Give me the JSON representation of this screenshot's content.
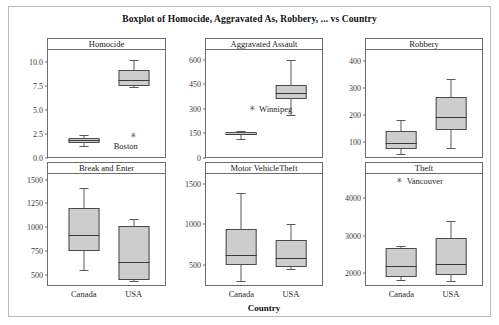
{
  "figure": {
    "title": "Boxplot of Homocide, Aggravated As, Robbery, ... vs Country",
    "xaxis_title": "Country",
    "categories": [
      "Canada",
      "USA"
    ],
    "box_fill": "#cdcdcd",
    "box_stroke": "#4a4a4a",
    "frame_color": "#b9b9b9"
  },
  "chart_data": {
    "type": "box",
    "title": "Boxplot of Homocide, Aggravated As, Robbery, ... vs Country",
    "xlabel": "Country",
    "ylabel": "",
    "grid": false,
    "legend": "none",
    "layout": "2 rows x 3 columns of panels",
    "categories": [
      "Canada",
      "USA"
    ],
    "panels": [
      {
        "name": "Homocide",
        "ylim": [
          0.0,
          11.3
        ],
        "yticks": [
          0.0,
          2.5,
          5.0,
          7.5,
          10.0
        ],
        "yticklabels": [
          "0.0",
          "2.5",
          "5.0",
          "7.5",
          "10.0"
        ],
        "boxes": [
          {
            "category": "Canada",
            "min": 1.25,
            "q1": 1.62,
            "median": 1.85,
            "q3": 2.05,
            "max": 2.45
          },
          {
            "category": "USA",
            "min": 7.45,
            "q1": 7.5,
            "median": 8.15,
            "q3": 9.2,
            "max": 10.25
          }
        ],
        "outliers": [
          {
            "category": "USA",
            "value": 2.3,
            "label": "Boston",
            "marker": "asterisk"
          }
        ]
      },
      {
        "name": "Aggravated Assault",
        "ylim": [
          0,
          660
        ],
        "yticks": [
          0,
          150,
          300,
          450,
          600
        ],
        "yticklabels": [
          "0",
          "150",
          "300",
          "450",
          "600"
        ],
        "boxes": [
          {
            "category": "Canada",
            "min": 118,
            "q1": 138,
            "median": 148,
            "q3": 160,
            "max": 168
          },
          {
            "category": "USA",
            "min": 262,
            "q1": 360,
            "median": 398,
            "q3": 448,
            "max": 600
          }
        ],
        "outliers": [
          {
            "category": "Canada",
            "value": 300,
            "label": "Winnipeg",
            "marker": "asterisk"
          }
        ]
      },
      {
        "name": "Robbery",
        "ylim": [
          40,
          440
        ],
        "yticks": [
          100,
          200,
          300,
          400
        ],
        "yticklabels": [
          "100",
          "200",
          "300",
          "400"
        ],
        "boxes": [
          {
            "category": "Canada",
            "min": 55,
            "q1": 75,
            "median": 97,
            "q3": 140,
            "max": 182
          },
          {
            "category": "USA",
            "min": 78,
            "q1": 145,
            "median": 192,
            "q3": 265,
            "max": 332
          }
        ],
        "outliers": []
      },
      {
        "name": "Break and Enter",
        "ylim": [
          380,
          1560
        ],
        "yticks": [
          500,
          750,
          1000,
          1250,
          1500
        ],
        "yticklabels": [
          "500",
          "750",
          "1000",
          "1250",
          "1500"
        ],
        "boxes": [
          {
            "category": "Canada",
            "min": 548,
            "q1": 745,
            "median": 915,
            "q3": 1200,
            "max": 1408
          },
          {
            "category": "USA",
            "min": 432,
            "q1": 440,
            "median": 635,
            "q3": 1008,
            "max": 1082
          }
        ],
        "outliers": []
      },
      {
        "name": "Motor VehicleTheft",
        "ylim": [
          240,
          1620
        ],
        "yticks": [
          500,
          1000,
          1500
        ],
        "yticklabels": [
          "500",
          "1000",
          "1500"
        ],
        "boxes": [
          {
            "category": "Canada",
            "min": 300,
            "q1": 495,
            "median": 620,
            "q3": 945,
            "max": 1390
          },
          {
            "category": "USA",
            "min": 455,
            "q1": 478,
            "median": 588,
            "q3": 805,
            "max": 1000
          }
        ],
        "outliers": []
      },
      {
        "name": "Theft",
        "ylim": [
          1650,
          4650
        ],
        "yticks": [
          2000,
          3000,
          4000
        ],
        "yticklabels": [
          "2000",
          "3000",
          "4000"
        ],
        "boxes": [
          {
            "category": "Canada",
            "min": 1810,
            "q1": 1900,
            "median": 2180,
            "q3": 2680,
            "max": 2720
          },
          {
            "category": "USA",
            "min": 1790,
            "q1": 1940,
            "median": 2240,
            "q3": 2940,
            "max": 3380
          }
        ],
        "outliers": [
          {
            "category": "Canada",
            "value": 4450,
            "label": "Vancouver",
            "marker": "asterisk"
          }
        ]
      }
    ]
  }
}
